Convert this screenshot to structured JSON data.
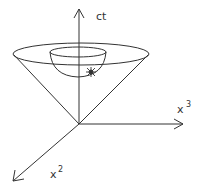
{
  "diagram": {
    "axes": {
      "time": {
        "label": "ct"
      },
      "x3": {
        "label": "x",
        "superscript": "3"
      },
      "x2": {
        "label": "x",
        "superscript": "2"
      }
    },
    "elements": [
      "outer-cone-ellipse",
      "inner-hemisphere",
      "event-flash",
      "cone-lines"
    ],
    "colors": {
      "stroke": "#333333",
      "background": "#ffffff"
    }
  }
}
